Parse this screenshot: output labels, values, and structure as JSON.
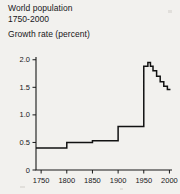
{
  "title": {
    "line1": "World population",
    "line2": "1750-2000",
    "line3": "Growth rate (percent)"
  },
  "chart_data": {
    "type": "line",
    "title": "World population 1750-2000",
    "subtitle": "Growth rate (percent)",
    "xlabel": "",
    "ylabel": "Growth rate (percent)",
    "xlim": [
      1740,
      2005
    ],
    "ylim": [
      0,
      2.05
    ],
    "grid": false,
    "legend": null,
    "style": "step",
    "x_ticks": [
      1750,
      1800,
      1850,
      1900,
      1950,
      2000
    ],
    "x_tick_labels": [
      "1750",
      "1800",
      "1850",
      "1900",
      "1950",
      "2000"
    ],
    "y_ticks": [
      0,
      0.5,
      1.0,
      1.5,
      2.0
    ],
    "y_tick_labels": [
      "0",
      "0.5",
      "1.0",
      "1.5",
      "2.0"
    ],
    "series": [
      {
        "name": "Growth rate",
        "steps": [
          {
            "x0": 1740,
            "x1": 1800,
            "y": 0.4
          },
          {
            "x0": 1800,
            "x1": 1850,
            "y": 0.5
          },
          {
            "x0": 1850,
            "x1": 1900,
            "y": 0.53
          },
          {
            "x0": 1900,
            "x1": 1950,
            "y": 0.79
          },
          {
            "x0": 1950,
            "x1": 1958,
            "y": 1.88
          },
          {
            "x0": 1958,
            "x1": 1963,
            "y": 1.95
          },
          {
            "x0": 1963,
            "x1": 1968,
            "y": 1.88
          },
          {
            "x0": 1968,
            "x1": 1975,
            "y": 1.8
          },
          {
            "x0": 1975,
            "x1": 1982,
            "y": 1.7
          },
          {
            "x0": 1982,
            "x1": 1989,
            "y": 1.6
          },
          {
            "x0": 1989,
            "x1": 1996,
            "y": 1.52
          },
          {
            "x0": 1996,
            "x1": 2002,
            "y": 1.46
          }
        ]
      }
    ]
  }
}
